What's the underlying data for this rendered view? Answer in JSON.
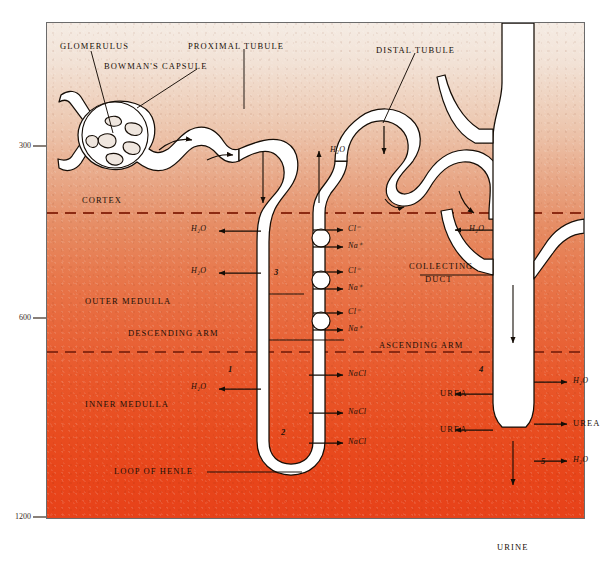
{
  "figure": {
    "panel_colors": {
      "cortex_top": "#f5ece4",
      "outer_medulla": "#e68a61",
      "inner_medulla_bottom": "#e7421a",
      "tubule_fill": "#ffffff",
      "outline": "#1a1008",
      "dashed_boundary": "#8c2a12"
    }
  },
  "axis": {
    "label_unit": "",
    "ticks": [
      {
        "value": "300",
        "y": 146
      },
      {
        "value": "600",
        "y": 318
      },
      {
        "value": "1200",
        "y": 517
      }
    ]
  },
  "zones": [
    {
      "name": "cortex",
      "label": "CORTEX"
    },
    {
      "name": "outer-medulla",
      "label": "OUTER MEDULLA"
    },
    {
      "name": "inner-medulla",
      "label": "INNER MEDULLA"
    }
  ],
  "structures": [
    {
      "name": "glomerulus",
      "label": "GLOMERULUS"
    },
    {
      "name": "bowmans-capsule",
      "label": "BOWMAN'S CAPSULE"
    },
    {
      "name": "proximal-tubule",
      "label": "PROXIMAL TUBULE"
    },
    {
      "name": "distal-tubule",
      "label": "DISTAL TUBULE"
    },
    {
      "name": "collecting-duct",
      "label": "COLLECTING"
    },
    {
      "name": "collecting-duct-2",
      "label": "DUCT"
    },
    {
      "name": "descending-arm",
      "label": "DESCENDING ARM"
    },
    {
      "name": "ascending-arm",
      "label": "ASCENDING ARM"
    },
    {
      "name": "loop-of-henle",
      "label": "LOOP OF HENLE"
    }
  ],
  "segment_numbers": [
    {
      "name": "segment-1",
      "label": "1"
    },
    {
      "name": "segment-2",
      "label": "2"
    },
    {
      "name": "segment-3",
      "label": "3"
    },
    {
      "name": "segment-4",
      "label": "4"
    },
    {
      "name": "segment-5",
      "label": "5"
    }
  ],
  "transport_labels": [
    {
      "name": "water-distal-in",
      "text": "H₂O",
      "species": "H2O"
    },
    {
      "name": "water-descending-1",
      "text": "H₂O",
      "species": "H2O"
    },
    {
      "name": "water-descending-2",
      "text": "H₂O",
      "species": "H2O"
    },
    {
      "name": "water-descending-3",
      "text": "H₂O",
      "species": "H2O"
    },
    {
      "name": "water-collecting-1",
      "text": "H₂O",
      "species": "H2O"
    },
    {
      "name": "water-collecting-2",
      "text": "H₂O",
      "species": "H2O"
    },
    {
      "name": "water-collecting-3",
      "text": "H₂O",
      "species": "H2O"
    },
    {
      "name": "chloride-1",
      "text": "Cl⁻",
      "species": "Cl-"
    },
    {
      "name": "sodium-1",
      "text": "Na⁺",
      "species": "Na+"
    },
    {
      "name": "chloride-2",
      "text": "Cl⁻",
      "species": "Cl-"
    },
    {
      "name": "sodium-2",
      "text": "Na⁺",
      "species": "Na+"
    },
    {
      "name": "chloride-3",
      "text": "Cl⁻",
      "species": "Cl-"
    },
    {
      "name": "sodium-3",
      "text": "Na⁺",
      "species": "Na+"
    },
    {
      "name": "nacl-1",
      "text": "NaCl",
      "species": "NaCl"
    },
    {
      "name": "nacl-2",
      "text": "NaCl",
      "species": "NaCl"
    },
    {
      "name": "nacl-3",
      "text": "NaCl",
      "species": "NaCl"
    },
    {
      "name": "urea-1",
      "text": "UREA",
      "species": "urea"
    },
    {
      "name": "urea-2",
      "text": "UREA",
      "species": "urea"
    },
    {
      "name": "urea-3",
      "text": "UREA",
      "species": "urea"
    }
  ],
  "output": {
    "name": "urine-outflow",
    "label": "URINE"
  }
}
